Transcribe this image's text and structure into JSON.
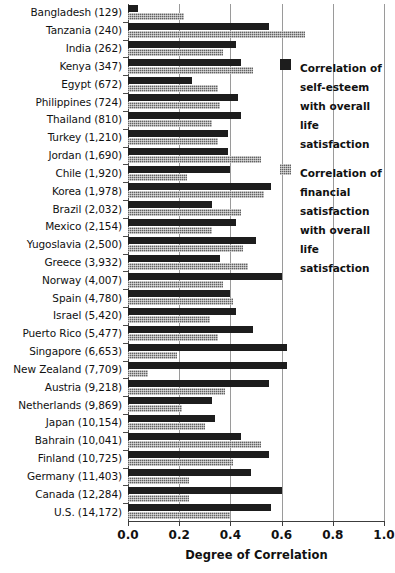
{
  "chart_data": {
    "type": "bar",
    "orientation": "horizontal",
    "title": "",
    "xlabel": "Degree of Correlation",
    "ylabel": "",
    "xlim": [
      0.0,
      1.0
    ],
    "xticks": [
      "0.0",
      "0.2",
      "0.4",
      "0.6",
      "0.8",
      "1.0"
    ],
    "xtick_values": [
      0.0,
      0.2,
      0.4,
      0.6,
      0.8,
      1.0
    ],
    "grid": "vertical",
    "legend_position": "upper-right-inside",
    "categories": [
      "Bangladesh (129)",
      "Tanzania (240)",
      "India (262)",
      "Kenya (347)",
      "Egypt (672)",
      "Philippines (724)",
      "Thailand (810)",
      "Turkey (1,210)",
      "Jordan (1,690)",
      "Chile (1,920)",
      "Korea (1,978)",
      "Brazil (2,032)",
      "Mexico (2,154)",
      "Yugoslavia (2,500)",
      "Greece (3,932)",
      "Norway (4,007)",
      "Spain (4,780)",
      "Israel (5,420)",
      "Puerto Rico (5,477)",
      "Singapore (6,653)",
      "New Zealand (7,709)",
      "Austria (9,218)",
      "Netherlands (9,869)",
      "Japan (10,154)",
      "Bahrain (10,041)",
      "Finland (10,725)",
      "Germany (11,403)",
      "Canada (12,284)",
      "U.S. (14,172)"
    ],
    "series": [
      {
        "name": "Correlation of self-esteem with overall life satisfaction",
        "color": "#1d1d1d",
        "values": [
          0.04,
          0.55,
          0.42,
          0.44,
          0.25,
          0.43,
          0.44,
          0.39,
          0.39,
          0.4,
          0.56,
          0.33,
          0.42,
          0.5,
          0.36,
          0.6,
          0.4,
          0.42,
          0.49,
          0.62,
          0.62,
          0.55,
          0.33,
          0.34,
          0.44,
          0.55,
          0.48,
          0.6,
          0.56
        ]
      },
      {
        "name": "Correlation of financial satisfaction with overall life satisfaction",
        "color": "#8d8d8d",
        "values": [
          0.22,
          0.69,
          0.37,
          0.49,
          0.35,
          0.36,
          0.33,
          0.35,
          0.52,
          0.23,
          0.53,
          0.44,
          0.33,
          0.45,
          0.47,
          0.37,
          0.41,
          0.32,
          0.35,
          0.19,
          0.08,
          0.38,
          0.21,
          0.3,
          0.52,
          0.41,
          0.24,
          0.24,
          0.4
        ]
      }
    ]
  },
  "legend": {
    "items": [
      {
        "swatch": "dark",
        "label": "Correlation of\nself-esteem\nwith overall life\nsatisfaction"
      },
      {
        "swatch": "light",
        "label": "Correlation of\nfinancial\nsatisfaction\nwith overall life\nsatisfaction"
      }
    ]
  }
}
